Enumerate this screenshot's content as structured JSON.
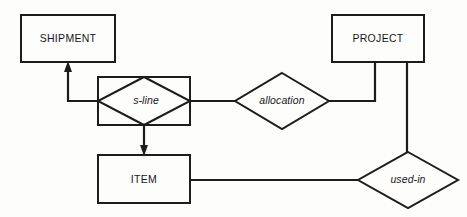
{
  "diagram": {
    "type": "entity-relationship-diagram",
    "notation": "Chen ER notation with identifying (double/boxed) relationship",
    "background_color": "#fdfdfc",
    "line_color": "#1c1c1c",
    "text_color": "#17171a",
    "entities": [
      {
        "id": "shipment",
        "label": "SHIPMENT",
        "shape": "rectangle",
        "x": 21,
        "y": 15,
        "width": 94,
        "height": 47
      },
      {
        "id": "project",
        "label": "PROJECT",
        "shape": "rectangle",
        "x": 332,
        "y": 15,
        "width": 92,
        "height": 47
      },
      {
        "id": "item",
        "label": "ITEM",
        "shape": "rectangle",
        "x": 98,
        "y": 155,
        "width": 92,
        "height": 48
      }
    ],
    "relationships": [
      {
        "id": "s-line",
        "label": "s-line",
        "shape": "diamond-in-rectangle",
        "identifying": true,
        "cx": 144,
        "cy": 101,
        "rx": 46,
        "ry": 24,
        "box": {
          "x": 98,
          "y": 77,
          "width": 92,
          "height": 48
        }
      },
      {
        "id": "allocation",
        "label": "allocation",
        "shape": "diamond",
        "identifying": false,
        "cx": 282,
        "cy": 101,
        "rx": 47,
        "ry": 28
      },
      {
        "id": "used-in",
        "label": "used-in",
        "shape": "diamond",
        "identifying": false,
        "cx": 408,
        "cy": 180,
        "rx": 50,
        "ry": 28
      }
    ],
    "connectors": [
      {
        "id": "s-line-to-shipment",
        "from": "s-line",
        "to": "shipment",
        "arrow": "to-shipment",
        "path": "M 98 101 L 68 101 L 68 66"
      },
      {
        "id": "s-line-to-item",
        "from": "s-line",
        "to": "item",
        "arrow": "to-item",
        "path": "M 144 125 L 144 151"
      },
      {
        "id": "s-line-to-allocation",
        "from": "s-line",
        "to": "allocation",
        "arrow": "none",
        "path": "M 190 101 L 235 101"
      },
      {
        "id": "allocation-to-project",
        "from": "allocation",
        "to": "project",
        "arrow": "none",
        "path": "M 329 101 L 375 101 L 375 62"
      },
      {
        "id": "project-to-used-in",
        "from": "project",
        "to": "used-in",
        "arrow": "none",
        "path": "M 407 62 L 407 152"
      },
      {
        "id": "item-to-used-in",
        "from": "item",
        "to": "used-in",
        "arrow": "none",
        "path": "M 190 180 L 358 180"
      }
    ]
  }
}
